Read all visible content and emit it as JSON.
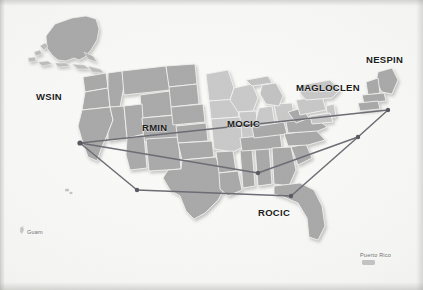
{
  "document": {
    "type": "map",
    "title": "RISS Regional Centers Network Map",
    "background_color": "#f4f4f2"
  },
  "map": {
    "landmass_fill": "#a8a8a8",
    "landmass_fill_light": "#c8c8c8",
    "state_border_color": "#f0f0ee",
    "network_line_color": "#6d6d75",
    "node_color": "#5a5a62",
    "regions": [
      {
        "id": "wsin",
        "label": "WSIN",
        "label_x": 36,
        "label_y": 96,
        "node_x": 80,
        "node_y": 143,
        "shade": "dark"
      },
      {
        "id": "rmin",
        "label": "RMIN",
        "label_x": 142,
        "label_y": 128,
        "node_x": 137,
        "node_y": 190,
        "shade": "dark"
      },
      {
        "id": "mocic",
        "label": "MOCIC",
        "label_x": 227,
        "label_y": 124,
        "node_x": 258,
        "node_y": 173,
        "shade": "light"
      },
      {
        "id": "rocic",
        "label": "ROCIC",
        "label_x": 258,
        "label_y": 213,
        "node_x": 291,
        "node_y": 196,
        "shade": "dark"
      },
      {
        "id": "magloclen",
        "label": "MAGLOCLEN",
        "label_x": 296,
        "label_y": 88,
        "node_x": 358,
        "node_y": 137,
        "shade": "light"
      },
      {
        "id": "nespin",
        "label": "NESPIN",
        "label_x": 366,
        "label_y": 60,
        "node_x": 388,
        "node_y": 110,
        "shade": "dark"
      }
    ],
    "insets": [
      {
        "id": "alaska",
        "label": "",
        "label_x": 0,
        "label_y": 0
      },
      {
        "id": "hawaii",
        "label": "",
        "label_x": 0,
        "label_y": 0
      },
      {
        "id": "guam",
        "label": "Guam",
        "label_x": 27,
        "label_y": 232
      },
      {
        "id": "puerto-rico",
        "label": "Puerto Rico",
        "label_x": 360,
        "label_y": 255
      }
    ],
    "connections": [
      {
        "from": "wsin",
        "to": "nespin"
      },
      {
        "from": "wsin",
        "to": "mocic"
      },
      {
        "from": "wsin",
        "to": "rmin"
      },
      {
        "from": "rmin",
        "to": "rocic"
      },
      {
        "from": "mocic",
        "to": "magloclen"
      },
      {
        "from": "rocic",
        "to": "magloclen"
      },
      {
        "from": "magloclen",
        "to": "nespin"
      }
    ]
  }
}
